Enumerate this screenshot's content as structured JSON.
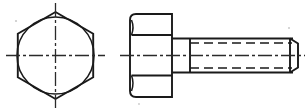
{
  "drawing": {
    "title": "Hexagon head bolt — two-view orthographic drawing",
    "line_color": "#1a1a1a",
    "background_color": "#ffffff",
    "views": [
      {
        "name": "end-view",
        "label": "End view (across flats / hexagon head)",
        "center": {
          "x": 55.5,
          "y": 55.5
        },
        "hexagon": {
          "orientation": "pointy-top",
          "circumradius": 43.5,
          "vertices": [
            {
              "x": 55.5,
              "y": 12.0
            },
            {
              "x": 93.2,
              "y": 33.8
            },
            {
              "x": 93.2,
              "y": 77.2
            },
            {
              "x": 55.5,
              "y": 99.0
            },
            {
              "x": 17.8,
              "y": 77.2
            },
            {
              "x": 17.8,
              "y": 33.8
            }
          ]
        },
        "circle": {
          "cx": 55.5,
          "cy": 55.5,
          "r": 38.5
        },
        "center_lines": {
          "horizontal": {
            "x1": 6,
            "x2": 105,
            "y": 55.5
          },
          "vertical": {
            "y1": 3,
            "y2": 108,
            "x": 55.5
          }
        }
      },
      {
        "name": "side-view",
        "label": "Side view (head and threaded shank)",
        "head": {
          "left": 130.0,
          "right": 172.0,
          "top": 14.0,
          "bottom": 97.0,
          "corner_radius": 6.0,
          "chamfer_division_lines_y": [
            35.0,
            75.5
          ],
          "chamfer_arc_bulge": 3.0
        },
        "shank": {
          "left": 172.0,
          "right": 298.0,
          "top": 38.5,
          "bottom": 72.5
        },
        "thread": {
          "start_x": 190.0,
          "end_x": 290.0,
          "root_offset": 4.5,
          "dash_pattern": "9 5",
          "hidden_root_lines_y": [
            43.0,
            68.0
          ],
          "center_hidden_line_y": 55.5
        },
        "point_chamfer": {
          "x_start": 290.0,
          "x_end": 298.0,
          "top": 38.5,
          "bottom": 72.5,
          "inset": 5.0
        },
        "center_line": {
          "x1": 120,
          "x2": 305,
          "y": 55.5
        }
      }
    ],
    "center_line_dash": "14 3 3 3",
    "specks": [
      {
        "x": 16,
        "y": 21,
        "r": 1.1
      },
      {
        "x": 289,
        "y": 28,
        "r": 1.0
      },
      {
        "x": 139,
        "y": 104,
        "r": 0.9
      }
    ]
  }
}
